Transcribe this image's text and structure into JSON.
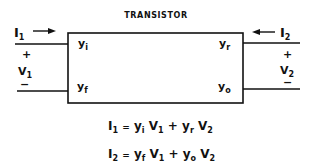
{
  "diagram": {
    "title": "TRANSISTOR",
    "input_port": {
      "current": "I",
      "current_sub": "1",
      "voltage": "V",
      "voltage_sub": "1",
      "plus": "+",
      "minus": "−"
    },
    "output_port": {
      "current": "I",
      "current_sub": "2",
      "voltage": "V",
      "voltage_sub": "2",
      "plus": "+",
      "minus": "−"
    },
    "parameters": {
      "top_left": {
        "base": "y",
        "sub": "i"
      },
      "bottom_left": {
        "base": "y",
        "sub": "f"
      },
      "top_right": {
        "base": "y",
        "sub": "r"
      },
      "bottom_right": {
        "base": "y",
        "sub": "o"
      }
    },
    "equations": [
      {
        "lhs": "I",
        "lhs_sub": "1",
        "eq": "=",
        "t1": "y",
        "t1_sub": "i",
        "t1_v": "V",
        "t1_vsub": "1",
        "plus": "+",
        "t2": "y",
        "t2_sub": "r",
        "t2_v": "V",
        "t2_vsub": "2"
      },
      {
        "lhs": "I",
        "lhs_sub": "2",
        "eq": "=",
        "t1": "y",
        "t1_sub": "f",
        "t1_v": "V",
        "t1_vsub": "1",
        "plus": "+",
        "t2": "y",
        "t2_sub": "o",
        "t2_v": "V",
        "t2_vsub": "2"
      }
    ]
  }
}
